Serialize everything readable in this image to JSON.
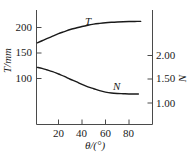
{
  "chart_data": {
    "type": "line",
    "title": "",
    "xlabel": "θ/(°)",
    "ylabel_left": "T/mm",
    "ylabel_right": "N",
    "xlim": [
      0,
      92
    ],
    "ylim_left": [
      60,
      230
    ],
    "ylim_right": [
      0.85,
      2.43
    ],
    "grid": false,
    "legend": "inline-curve-labels",
    "xticks": [
      20,
      40,
      60,
      80
    ],
    "xtick_labels": [
      "20",
      "40",
      "60",
      "80"
    ],
    "yticks_left": [
      100,
      150,
      200
    ],
    "ytick_labels_left": [
      "100",
      "150",
      "200"
    ],
    "yticks_right": [
      1.0,
      1.5,
      2.0
    ],
    "ytick_labels_right": [
      "1.00",
      "1.50",
      "2.00"
    ],
    "series": [
      {
        "name": "T",
        "label": "T",
        "axis": "left",
        "color": "#1a1a1a",
        "x": [
          2,
          6,
          10,
          15,
          20,
          25,
          30,
          35,
          40,
          45,
          50,
          55,
          60,
          65,
          70,
          75,
          80,
          85,
          90
        ],
        "values": [
          170,
          174,
          178,
          183,
          188,
          192,
          196,
          199,
          202,
          204.5,
          206.5,
          208,
          209.3,
          210.2,
          210.9,
          211.4,
          211.7,
          211.9,
          212
        ]
      },
      {
        "name": "N",
        "label": "N",
        "axis": "right",
        "color": "#1a1a1a",
        "x": [
          2,
          6,
          10,
          15,
          20,
          25,
          30,
          35,
          40,
          45,
          50,
          55,
          60,
          65,
          70,
          75,
          80,
          85,
          88
        ],
        "values": [
          1.75,
          1.73,
          1.7,
          1.66,
          1.61,
          1.56,
          1.5,
          1.45,
          1.39,
          1.34,
          1.3,
          1.26,
          1.23,
          1.21,
          1.2,
          1.195,
          1.19,
          1.19,
          1.19
        ]
      }
    ],
    "annotations": [
      {
        "text": "T",
        "x": 40,
        "axis": "left",
        "note": "label above upper curve"
      },
      {
        "text": "N",
        "x": 63,
        "axis": "right",
        "note": "label above lower curve"
      }
    ]
  },
  "axes": {
    "left_title": "T/mm",
    "right_title": "N",
    "bottom_title": "θ/(°)"
  },
  "ticks": {
    "left": [
      "200",
      "150",
      "100"
    ],
    "right": [
      "2.00",
      "1.50",
      "1.00"
    ],
    "bottom": [
      "20",
      "40",
      "60",
      "80"
    ]
  },
  "curves": {
    "upper_label": "T",
    "lower_label": "N"
  },
  "colors": {
    "curve": "#1a1a1a",
    "axis": "#4a4a4a",
    "background": "#ffffff"
  }
}
